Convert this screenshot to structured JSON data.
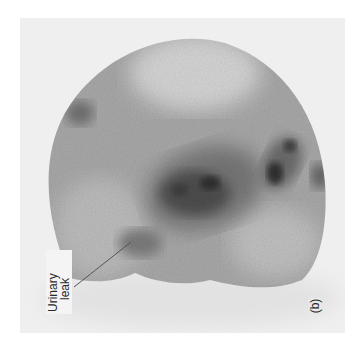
{
  "figure": {
    "type": "nuclear medicine scintigram (renal/bladder scan)",
    "panel_label": "(b)",
    "annotation": {
      "line1": "Urinary",
      "line2": "leak"
    },
    "colors": {
      "background": "#efefef",
      "uptake_dark": "#2e2e2e",
      "tissue_mid": "#8a8a8a",
      "tissue_light": "#c4c4c4"
    }
  }
}
